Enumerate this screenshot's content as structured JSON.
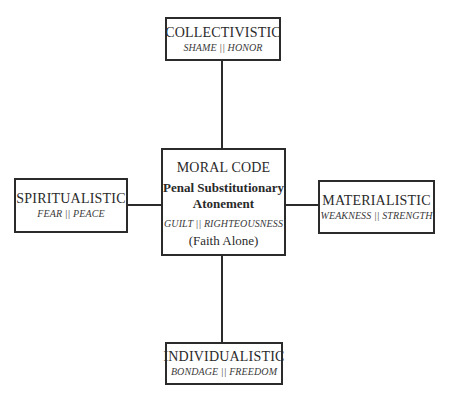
{
  "diagram": {
    "center": {
      "title": "MORAL CODE",
      "approach_line1": "Penal Substitutionary",
      "approach_line2": "Atonement",
      "subtitle": "GUILT || RIGHTEOUSNESS",
      "note": "(Faith Alone)"
    },
    "top": {
      "title": "COLLECTIVISTIC",
      "subtitle": "SHAME || HONOR"
    },
    "left": {
      "title": "SPIRITUALISTIC",
      "subtitle": "FEAR || PEACE"
    },
    "right": {
      "title": "MATERIALISTIC",
      "subtitle": "WEAKNESS || STRENGTH"
    },
    "bottom": {
      "title": "INDIVIDUALISTIC",
      "subtitle": "BONDAGE || FREEDOM"
    },
    "colors": {
      "line": "#2b2b2b",
      "background": "#ffffff",
      "text": "#2a2a2a"
    }
  }
}
